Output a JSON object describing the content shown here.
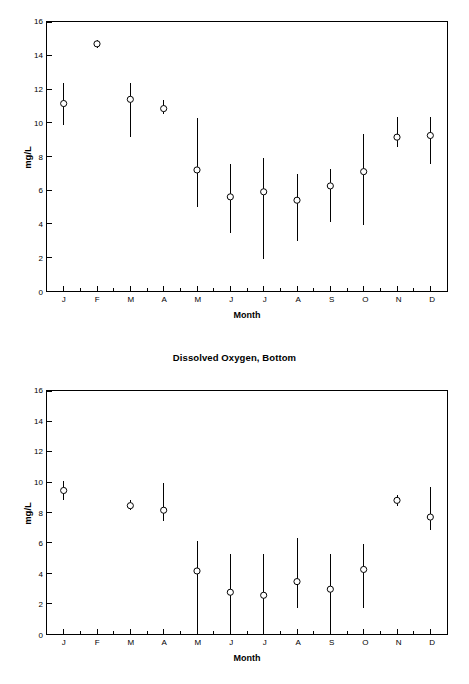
{
  "page": {
    "background": "#ffffff",
    "axis_color": "#000000",
    "marker_color": "#000000"
  },
  "charts": [
    {
      "id": "dissolved-oxygen-surface",
      "title": "",
      "ylabel": "mg/L",
      "xlabel": "Month"
    },
    {
      "id": "dissolved-oxygen-bottom",
      "title": "Dissolved Oxygen, Bottom",
      "ylabel": "mg/L",
      "xlabel": "Month"
    }
  ],
  "chart_data": [
    {
      "type": "scatter",
      "id": "dissolved-oxygen-surface",
      "title": "",
      "xlabel": "Month",
      "ylabel": "mg/L",
      "grid": false,
      "legend": "none",
      "ylim": [
        0,
        16
      ],
      "yticks": [
        0,
        2,
        4,
        6,
        8,
        10,
        12,
        14,
        16
      ],
      "ytick_labels": [
        "0",
        "2",
        "4",
        "6",
        "8",
        "10",
        "12",
        "14",
        "16"
      ],
      "categories": [
        "J",
        "F",
        "M",
        "A",
        "M",
        "J",
        "J",
        "A",
        "S",
        "O",
        "N",
        "D"
      ],
      "category_names": [
        "January",
        "February",
        "March",
        "April",
        "May",
        "June",
        "July",
        "August",
        "September",
        "October",
        "November",
        "December"
      ],
      "series": [
        {
          "name": "Dissolved Oxygen, Surface",
          "marker": "open-circle",
          "values": [
            11.15,
            14.7,
            11.4,
            10.85,
            7.2,
            5.6,
            5.9,
            5.4,
            6.25,
            7.1,
            9.15,
            9.25
          ],
          "error_low": [
            9.9,
            14.45,
            9.15,
            10.5,
            5.0,
            3.45,
            1.9,
            3.0,
            4.1,
            3.9,
            8.55,
            7.55
          ],
          "error_high": [
            12.35,
            14.95,
            12.4,
            11.35,
            10.3,
            7.55,
            7.9,
            6.95,
            7.25,
            9.35,
            10.35,
            10.35
          ]
        }
      ]
    },
    {
      "type": "scatter",
      "id": "dissolved-oxygen-bottom",
      "title": "Dissolved Oxygen, Bottom",
      "xlabel": "Month",
      "ylabel": "mg/L",
      "grid": false,
      "legend": "none",
      "ylim": [
        0,
        16
      ],
      "yticks": [
        0,
        2,
        4,
        6,
        8,
        10,
        12,
        14,
        16
      ],
      "ytick_labels": [
        "0",
        "2",
        "4",
        "6",
        "8",
        "10",
        "12",
        "14",
        "16"
      ],
      "categories": [
        "J",
        "F",
        "M",
        "A",
        "M",
        "J",
        "J",
        "A",
        "S",
        "O",
        "N",
        "D"
      ],
      "category_names": [
        "January",
        "February",
        "March",
        "April",
        "May",
        "June",
        "July",
        "August",
        "September",
        "October",
        "November",
        "December"
      ],
      "series": [
        {
          "name": "Dissolved Oxygen, Bottom",
          "marker": "open-circle",
          "values": [
            9.45,
            null,
            8.45,
            8.15,
            4.15,
            2.75,
            2.55,
            3.45,
            2.95,
            4.25,
            8.8,
            7.7
          ],
          "error_low": [
            8.8,
            null,
            8.15,
            7.45,
            0.0,
            0.0,
            0.0,
            1.7,
            0.25,
            1.7,
            8.45,
            6.85
          ],
          "error_high": [
            10.1,
            null,
            8.8,
            9.95,
            6.15,
            5.3,
            5.3,
            6.3,
            5.25,
            5.95,
            9.15,
            9.65
          ]
        }
      ]
    }
  ]
}
